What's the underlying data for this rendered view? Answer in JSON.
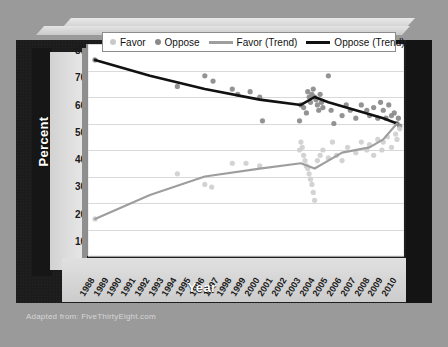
{
  "footer": {
    "source": "Adapted from: FiveThirtyEight.com"
  },
  "legend": {
    "items": [
      {
        "label": "Favor",
        "marker": "dot",
        "color": "#c9c9c9"
      },
      {
        "label": "Oppose",
        "marker": "dot",
        "color": "#8a8a8a"
      },
      {
        "label": "Favor (Trend)",
        "marker": "line",
        "color": "#9e9e9e"
      },
      {
        "label": "Oppose (Trend)",
        "marker": "line",
        "color": "#111111"
      }
    ]
  },
  "chart_data": {
    "type": "scatter",
    "title": "",
    "xlabel": "Year",
    "ylabel": "Percent",
    "ylim": [
      0,
      80
    ],
    "ytick_step": 10,
    "yticks": [
      80,
      70,
      60,
      50,
      40,
      30,
      20,
      10,
      0
    ],
    "grid": true,
    "legend_position": "top",
    "categories": [
      "1988",
      "1989",
      "1990",
      "1991",
      "1992",
      "1993",
      "1994",
      "1995",
      "1996",
      "1997",
      "1998",
      "1999",
      "2000",
      "2001",
      "2002",
      "2003",
      "2004",
      "2005",
      "2006",
      "2007",
      "2008",
      "2009",
      "2010"
    ],
    "series": [
      {
        "name": "Oppose (Trend)",
        "type": "line",
        "color": "#111111",
        "x": [
          "1988",
          "1992",
          "1996",
          "2000",
          "2003",
          "2004",
          "2005",
          "2007",
          "2009",
          "2010"
        ],
        "values": [
          74,
          68,
          63,
          59,
          57,
          60,
          58,
          55,
          52,
          50
        ]
      },
      {
        "name": "Favor (Trend)",
        "type": "line",
        "color": "#9e9e9e",
        "x": [
          "1988",
          "1992",
          "1996",
          "2000",
          "2003",
          "2004",
          "2005",
          "2006",
          "2008",
          "2009",
          "2010"
        ],
        "values": [
          14,
          23,
          30,
          33,
          35,
          33,
          36,
          39,
          41,
          44,
          50
        ]
      },
      {
        "name": "Oppose",
        "type": "scatter",
        "color": "#8a8a8a",
        "points": [
          [
            1988,
            74
          ],
          [
            1994,
            64
          ],
          [
            1996,
            68
          ],
          [
            1996.6,
            66
          ],
          [
            1998,
            63
          ],
          [
            1998.4,
            61
          ],
          [
            1999.3,
            62
          ],
          [
            2000,
            60
          ],
          [
            2000.2,
            51
          ],
          [
            2002.9,
            51
          ],
          [
            2003.0,
            57
          ],
          [
            2003.2,
            56
          ],
          [
            2003.4,
            54
          ],
          [
            2003.5,
            62
          ],
          [
            2003.6,
            60
          ],
          [
            2003.7,
            58
          ],
          [
            2003.8,
            61
          ],
          [
            2003.9,
            63
          ],
          [
            2004.0,
            60
          ],
          [
            2004.1,
            59
          ],
          [
            2004.2,
            57
          ],
          [
            2004.3,
            55
          ],
          [
            2004.4,
            61
          ],
          [
            2004.5,
            58
          ],
          [
            2004.6,
            56
          ],
          [
            2005.0,
            68
          ],
          [
            2005.2,
            55
          ],
          [
            2005.4,
            50
          ],
          [
            2006.0,
            53
          ],
          [
            2006.3,
            57
          ],
          [
            2006.6,
            55
          ],
          [
            2007.0,
            52
          ],
          [
            2007.4,
            57
          ],
          [
            2007.8,
            55
          ],
          [
            2008.0,
            53
          ],
          [
            2008.3,
            56
          ],
          [
            2008.6,
            52
          ],
          [
            2008.8,
            58
          ],
          [
            2009.0,
            55
          ],
          [
            2009.2,
            52
          ],
          [
            2009.4,
            57
          ],
          [
            2009.6,
            53
          ],
          [
            2009.8,
            54
          ],
          [
            2010.0,
            50
          ],
          [
            2010.1,
            52
          ],
          [
            2010.2,
            49
          ]
        ]
      },
      {
        "name": "Favor",
        "type": "scatter",
        "color": "#cfcfcf",
        "points": [
          [
            1988,
            14
          ],
          [
            1994,
            31
          ],
          [
            1996,
            27
          ],
          [
            1996.5,
            26
          ],
          [
            1998,
            35
          ],
          [
            1999,
            35
          ],
          [
            2000,
            34
          ],
          [
            2002.9,
            40
          ],
          [
            2003.0,
            43
          ],
          [
            2003.1,
            41
          ],
          [
            2003.2,
            38
          ],
          [
            2003.3,
            36
          ],
          [
            2003.4,
            34
          ],
          [
            2003.5,
            33
          ],
          [
            2003.6,
            31
          ],
          [
            2003.7,
            29
          ],
          [
            2003.8,
            27
          ],
          [
            2003.9,
            24
          ],
          [
            2004.0,
            21
          ],
          [
            2004.2,
            36
          ],
          [
            2004.4,
            38
          ],
          [
            2004.6,
            40
          ],
          [
            2005.0,
            37
          ],
          [
            2005.3,
            43
          ],
          [
            2005.6,
            38
          ],
          [
            2006.0,
            36
          ],
          [
            2006.4,
            41
          ],
          [
            2007.0,
            39
          ],
          [
            2007.4,
            43
          ],
          [
            2007.8,
            40
          ],
          [
            2008.0,
            42
          ],
          [
            2008.3,
            38
          ],
          [
            2008.6,
            44
          ],
          [
            2008.9,
            40
          ],
          [
            2009.0,
            43
          ],
          [
            2009.3,
            45
          ],
          [
            2009.6,
            41
          ],
          [
            2009.9,
            46
          ],
          [
            2010.0,
            44
          ],
          [
            2010.2,
            48
          ]
        ]
      }
    ]
  }
}
